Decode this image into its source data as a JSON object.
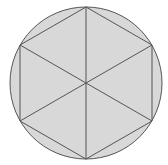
{
  "diagram": {
    "canvas": {
      "width": 168,
      "height": 165
    },
    "center": {
      "x": 86,
      "y": 83
    },
    "radius": 76,
    "colors": {
      "background": "#ffffff",
      "fill": "#d8d8d8",
      "stroke": "#555555"
    },
    "hexagon_vertices": [
      {
        "x": 86,
        "y": 7
      },
      {
        "x": 152,
        "y": 45
      },
      {
        "x": 152,
        "y": 121
      },
      {
        "x": 86,
        "y": 159
      },
      {
        "x": 20,
        "y": 121
      },
      {
        "x": 20,
        "y": 45
      }
    ]
  }
}
